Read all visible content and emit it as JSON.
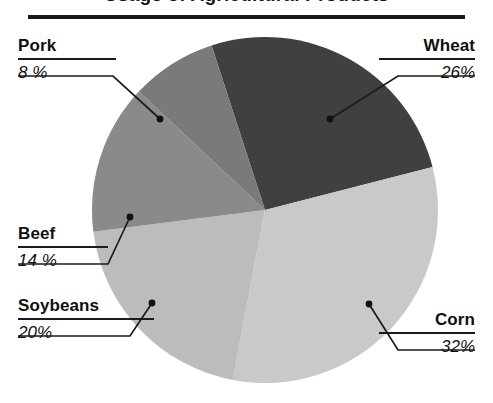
{
  "chart": {
    "title": "Usage of Agricultural Products",
    "rule_color": "#1b1b1b",
    "background": "#ffffff"
  },
  "chart_data": {
    "type": "pie",
    "title": "Usage of Agricultural Products",
    "xlabel": "",
    "ylabel": "",
    "grid": false,
    "legend": "none",
    "labels_position": "outside-leader-lines",
    "start_angle_deg": -18,
    "direction": "clockwise",
    "categories": [
      "Wheat",
      "Corn",
      "Soybeans",
      "Beef",
      "Pork"
    ],
    "values": [
      26,
      32,
      20,
      14,
      8
    ],
    "value_suffix": "%",
    "colors": [
      "#404040",
      "#c9c9c9",
      "#bcbcbc",
      "#8a8a8a",
      "#7a7a7a"
    ],
    "slices": [
      {
        "name": "Wheat",
        "value": 26,
        "label": "Wheat",
        "percent_text": "26%",
        "color": "#404040",
        "side": "right"
      },
      {
        "name": "Corn",
        "value": 32,
        "label": "Corn",
        "percent_text": "32%",
        "color": "#c9c9c9",
        "side": "right"
      },
      {
        "name": "Soybeans",
        "value": 20,
        "label": "Soybeans",
        "percent_text": "20%",
        "color": "#bcbcbc",
        "side": "left"
      },
      {
        "name": "Beef",
        "value": 14,
        "label": "Beef",
        "percent_text": "14 %",
        "color": "#8a8a8a",
        "side": "left"
      },
      {
        "name": "Pork",
        "value": 8,
        "label": "Pork",
        "percent_text": "8 %",
        "color": "#7a7a7a",
        "side": "left"
      }
    ]
  }
}
